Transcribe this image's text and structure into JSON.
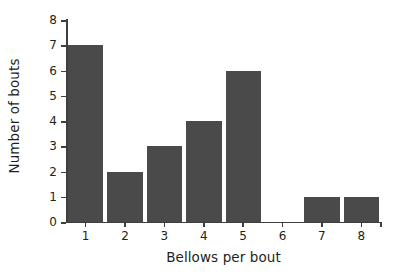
{
  "chart_data": {
    "type": "bar",
    "title": "",
    "xlabel": "Bellows per bout",
    "ylabel": "Number of bouts",
    "categories": [
      "1",
      "2",
      "3",
      "4",
      "5",
      "6",
      "7",
      "8"
    ],
    "values": [
      7,
      2,
      3,
      4,
      6,
      0,
      1,
      1
    ],
    "xtick_labels": [
      "1",
      "2",
      "3",
      "4",
      "5",
      "6",
      "7",
      "8"
    ],
    "ytick_labels": [
      "0",
      "1",
      "2",
      "3",
      "4",
      "5",
      "6",
      "7",
      "8"
    ],
    "ytick_values": [
      0,
      1,
      2,
      3,
      4,
      5,
      6,
      7,
      8
    ],
    "ylim": [
      0,
      8
    ],
    "grid": false,
    "legend": null,
    "bar_color": "#4a4a4a",
    "axis_color": "#3f3f3f",
    "background_color": "#ffffff",
    "text_color": "#231f20"
  }
}
